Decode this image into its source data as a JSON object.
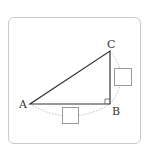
{
  "diagram": {
    "type": "right-triangle",
    "vertices": [
      {
        "label": "A",
        "x": 30,
        "y": 104
      },
      {
        "label": "B",
        "x": 110,
        "y": 104
      },
      {
        "label": "C",
        "x": 110,
        "y": 51
      }
    ],
    "right_angle_at": "B",
    "answer_boxes": [
      {
        "side": "BC",
        "value": ""
      },
      {
        "side": "AB",
        "value": ""
      }
    ],
    "colors": {
      "line": "#333333",
      "arc": "#bdbdbd",
      "frame": "#c9c9c9",
      "box": "#9a9a9a"
    }
  }
}
